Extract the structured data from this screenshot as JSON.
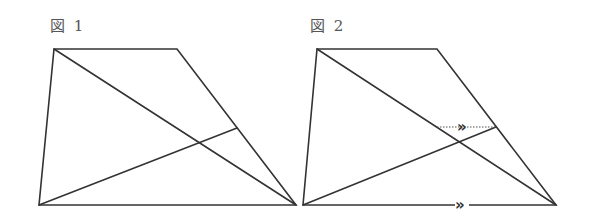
{
  "figures": [
    {
      "label": "図 1",
      "vertices": {
        "top_left": [
          54,
          49
        ],
        "top_right": [
          177,
          49
        ],
        "bottom_right": [
          296,
          205
        ],
        "bottom_left": [
          39,
          205
        ]
      },
      "segments": [
        {
          "name": "trapezoid-top",
          "from": [
            54,
            49
          ],
          "to": [
            177,
            49
          ]
        },
        {
          "name": "trapezoid-right-leg",
          "from": [
            177,
            49
          ],
          "to": [
            296,
            205
          ]
        },
        {
          "name": "trapezoid-base",
          "from": [
            296,
            205
          ],
          "to": [
            39,
            205
          ]
        },
        {
          "name": "trapezoid-left-leg",
          "from": [
            39,
            205
          ],
          "to": [
            54,
            49
          ]
        },
        {
          "name": "diagonal",
          "from": [
            54,
            49
          ],
          "to": [
            296,
            205
          ]
        },
        {
          "name": "cevian-to-right-leg",
          "from": [
            39,
            205
          ],
          "to": [
            237,
            128
          ]
        }
      ]
    },
    {
      "label": "図 2",
      "vertices": {
        "top_left": [
          317,
          49
        ],
        "top_right": [
          437,
          49
        ],
        "bottom_right": [
          556,
          205
        ],
        "bottom_left": [
          303,
          205
        ]
      },
      "segments": [
        {
          "name": "trapezoid-top",
          "from": [
            317,
            49
          ],
          "to": [
            437,
            49
          ]
        },
        {
          "name": "trapezoid-right-leg",
          "from": [
            437,
            49
          ],
          "to": [
            556,
            205
          ]
        },
        {
          "name": "trapezoid-base",
          "from": [
            556,
            205
          ],
          "to": [
            303,
            205
          ]
        },
        {
          "name": "trapezoid-left-leg",
          "from": [
            303,
            205
          ],
          "to": [
            317,
            49
          ]
        },
        {
          "name": "diagonal",
          "from": [
            317,
            49
          ],
          "to": [
            556,
            205
          ]
        },
        {
          "name": "cevian-to-right-leg",
          "from": [
            303,
            205
          ],
          "to": [
            496,
            127
          ]
        }
      ],
      "auxiliary_line": {
        "style": "dotted",
        "from": [
          437,
          127
        ],
        "to": [
          496,
          127
        ]
      },
      "parallel_marks": [
        {
          "glyph": "»",
          "position": [
            464,
            127
          ],
          "on": "auxiliary_line"
        },
        {
          "glyph": "»",
          "position": [
            462,
            205
          ],
          "on": "trapezoid-base"
        }
      ]
    }
  ]
}
